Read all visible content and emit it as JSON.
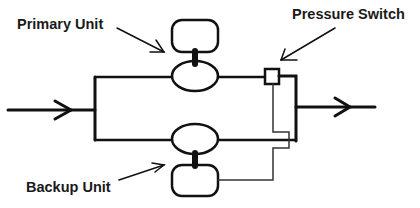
{
  "diagram": {
    "labels": {
      "primary": "Primary Unit",
      "backup": "Backup Unit",
      "switch": "Pressure Switch"
    },
    "components": [
      {
        "id": "primary-unit",
        "label": "Primary Unit",
        "shape": "rounded-box + oval"
      },
      {
        "id": "backup-unit",
        "label": "Backup Unit",
        "shape": "oval + rounded-box"
      },
      {
        "id": "pressure-switch",
        "label": "Pressure Switch",
        "shape": "square"
      }
    ],
    "flow": {
      "inlet": "left arrow",
      "outlet": "right arrow"
    },
    "colors": {
      "line": "#111111",
      "background": "#ffffff"
    }
  }
}
